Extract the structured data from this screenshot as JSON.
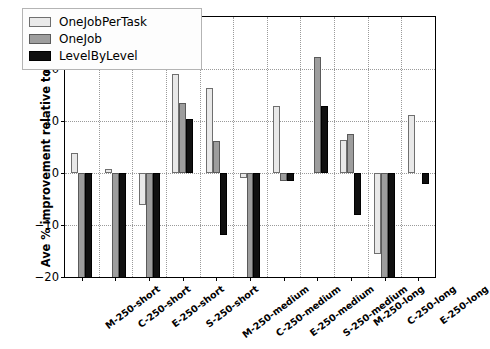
{
  "chart_data": {
    "type": "bar",
    "title": "",
    "xlabel": "",
    "ylabel": "Ave % improvement relative to Zhang",
    "ylim": [
      -20,
      30
    ],
    "yticks": [
      -20,
      -10,
      0,
      10,
      20,
      30
    ],
    "grid": true,
    "legend_position": "upper left",
    "categories": [
      "M-250-short",
      "C-250-short",
      "E-250-short",
      "S-250-short",
      "M-250-medium",
      "C-250-medium",
      "E-250-medium",
      "S-250-medium",
      "M-250-long",
      "C-250-long",
      "E-250-long"
    ],
    "series": [
      {
        "name": "OneJobPerTask",
        "color": "#e9e9e9",
        "values": [
          3.9,
          0.8,
          -6.2,
          19.0,
          16.3,
          -1.0,
          12.9,
          0.0,
          6.3,
          -15.5,
          11.1
        ]
      },
      {
        "name": "OneJob",
        "color": "#9d9d9d",
        "values": [
          -24.0,
          -24.0,
          -24.0,
          13.4,
          6.2,
          -24.0,
          -1.6,
          22.4,
          7.5,
          -24.0,
          0.0
        ]
      },
      {
        "name": "LevelByLevel",
        "color": "#101010",
        "values": [
          -24.0,
          -24.0,
          -24.0,
          10.3,
          -12.0,
          -24.0,
          -1.6,
          12.8,
          -8.0,
          -24.0,
          -2.1
        ]
      }
    ]
  },
  "legend": {
    "entries": [
      {
        "label": "OneJobPerTask",
        "swatch": "light-gray-swatch"
      },
      {
        "label": "OneJob",
        "swatch": "medium-gray-swatch"
      },
      {
        "label": "LevelByLevel",
        "swatch": "black-swatch"
      }
    ]
  },
  "axes": {
    "y_label_text": "Ave % improvement relative to Zhang",
    "y_tick_labels": [
      "30",
      "20",
      "10",
      "0",
      "−10",
      "−20"
    ]
  }
}
